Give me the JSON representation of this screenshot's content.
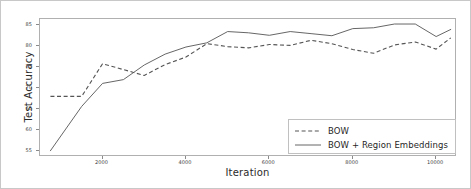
{
  "chart_data": {
    "type": "line",
    "title": "",
    "xlabel": "Iteration",
    "ylabel": "Test Accuracy",
    "xlim": [
      500,
      10500
    ],
    "ylim": [
      53.5,
      86.5
    ],
    "xticks": [
      2000,
      4000,
      6000,
      8000,
      10000
    ],
    "xtick_labels": [
      "2000",
      "4000",
      "6000",
      "8000",
      "10000"
    ],
    "yticks": [
      55,
      60,
      65,
      70,
      75,
      80,
      85
    ],
    "ytick_labels": [
      "55",
      "60",
      "65",
      "70",
      "75",
      "80",
      "85"
    ],
    "grid": false,
    "legend_position": "lower right",
    "series": [
      {
        "name": "BOW",
        "style": "dashed",
        "color": "#555555",
        "x": [
          750,
          1500,
          2000,
          2500,
          3000,
          3500,
          4000,
          4500,
          5000,
          5500,
          6000,
          6500,
          7000,
          7500,
          8000,
          8500,
          9000,
          9500,
          10000,
          10350
        ],
        "values": [
          68.0,
          68.0,
          75.8,
          74.4,
          73.0,
          75.6,
          77.4,
          80.6,
          79.9,
          79.6,
          80.4,
          80.2,
          81.4,
          80.6,
          79.2,
          78.3,
          80.3,
          81.0,
          79.3,
          82.0
        ]
      },
      {
        "name": "BOW + Region Embeddings",
        "style": "solid",
        "color": "#555555",
        "x": [
          750,
          1500,
          2000,
          2500,
          3000,
          3500,
          4000,
          4500,
          5000,
          5500,
          6000,
          6500,
          7000,
          7500,
          8000,
          8500,
          9000,
          9500,
          10000,
          10350
        ],
        "values": [
          55.0,
          65.6,
          71.1,
          72.0,
          75.5,
          78.1,
          79.8,
          80.8,
          83.5,
          83.2,
          82.6,
          83.5,
          83.0,
          82.5,
          84.2,
          84.4,
          85.3,
          85.3,
          82.3,
          84.0
        ]
      }
    ]
  },
  "legend": {
    "items": [
      {
        "label": "BOW",
        "style": "dashed"
      },
      {
        "label": "BOW + Region Embeddings",
        "style": "solid"
      }
    ]
  }
}
